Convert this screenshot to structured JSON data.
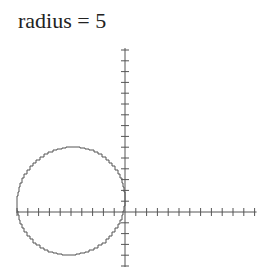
{
  "title": "radius = 5",
  "chart_data": {
    "type": "line",
    "title": "radius = 5",
    "xlabel": "",
    "ylabel": "",
    "grid": false,
    "legend": null,
    "axes": {
      "x_range": [
        -10,
        12
      ],
      "y_range": [
        -5,
        15
      ],
      "tick_spacing": 1,
      "tick_labels": false
    },
    "series": [
      {
        "name": "circle",
        "shape": "circle",
        "center": [
          -5,
          1
        ],
        "radius": 5,
        "stroke": "#555555",
        "stepped": true
      }
    ]
  },
  "colors": {
    "axis": "#555555",
    "curve": "#555555",
    "background": "#ffffff"
  }
}
